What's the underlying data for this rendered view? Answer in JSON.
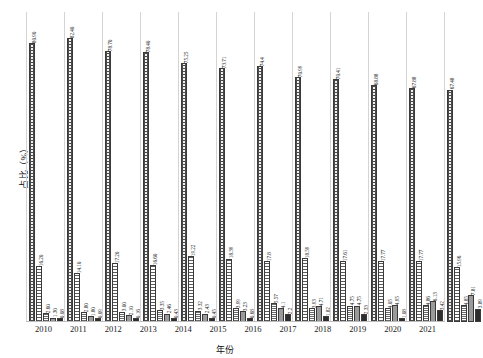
{
  "chart_data": {
    "type": "bar",
    "title": "",
    "xlabel": "年份",
    "ylabel": "占比（%）",
    "ylim": [
      0,
      90
    ],
    "grid": true,
    "legend_position": "none",
    "categories": [
      "2010",
      "2011",
      "2012",
      "2013",
      "2014",
      "2015",
      "2016",
      "2017",
      "2018",
      "2019",
      "2020",
      "2021"
    ],
    "series": [
      {
        "name": "系列1",
        "values": [
          80.9,
          82.4,
          78.7,
          78.4,
          75.25,
          73.71,
          74.4,
          70.99,
          70.41,
          68.88,
          67.88,
          67.48
        ],
        "labels": [
          "80.90",
          "82.40",
          "78.70",
          "78.40",
          "75.25",
          "73.71",
          "74.4",
          "70.99",
          "70.41",
          "68.88",
          "67.88",
          "67.48"
        ]
      },
      {
        "name": "系列2",
        "values": [
          16.2,
          14.1,
          17.2,
          16.6,
          19.22,
          18.39,
          17.8,
          18.59,
          17.61,
          17.77,
          17.77,
          15.96
        ],
        "labels": [
          "16.20",
          "14.10",
          "17.20",
          "16.60",
          "19.22",
          "18.39",
          "17.8",
          "18.59",
          "17.61",
          "17.77",
          "17.77",
          "15.96"
        ]
      },
      {
        "name": "系列3",
        "values": [
          2.6,
          2.8,
          3.0,
          3.35,
          3.32,
          3.99,
          5.57,
          3.93,
          4.75,
          4.05,
          4.86,
          4.85
        ],
        "labels": [
          "2.60",
          "2.80",
          "3.00",
          "3.35",
          "3.32",
          "3.99",
          "5.57",
          "3.93",
          "4.75",
          "4.05",
          "4.86",
          "4.85"
        ]
      },
      {
        "name": "系列4",
        "values": [
          1.3,
          1.8,
          2.1,
          2.46,
          2.43,
          3.23,
          4.1,
          4.71,
          4.75,
          4.95,
          6.13,
          7.81
        ],
        "labels": [
          "1.30",
          "1.80",
          "2.10",
          "2.46",
          "2.43",
          "3.23",
          "4.1",
          "4.71",
          "4.75",
          "4.95",
          "6.13",
          "7.81"
        ]
      },
      {
        "name": "系列5",
        "values": [
          0.08,
          0.09,
          0.16,
          0.43,
          0.45,
          0.68,
          2.2,
          1.82,
          2.33,
          1.08,
          3.42,
          3.89
        ],
        "labels": [
          "0.08",
          "0.09",
          "0.16",
          "0.43",
          "0.45",
          "0.68",
          "2.2",
          "1.82",
          "2.33",
          "1.08",
          "3.42",
          "3.89"
        ]
      }
    ]
  }
}
